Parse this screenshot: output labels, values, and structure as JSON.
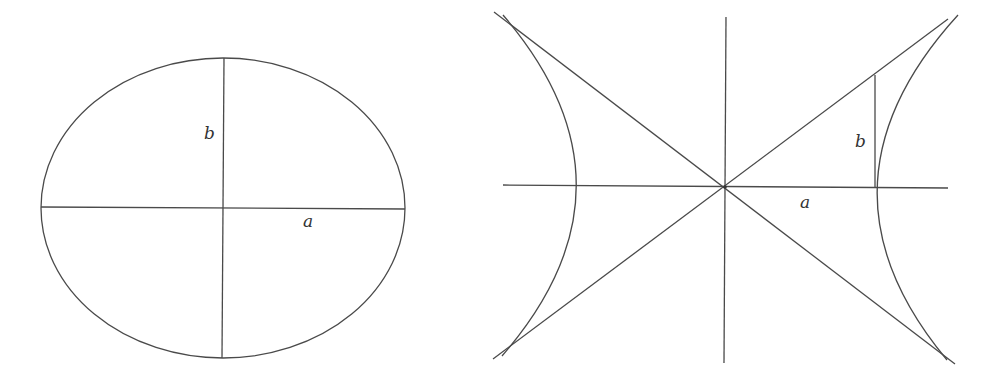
{
  "figures": [
    {
      "name": "ellipse",
      "labels": {
        "semi_minor": "b",
        "semi_major": "a"
      },
      "geometry": {
        "cx": 223,
        "cy": 208,
        "rx": 182,
        "ry": 150
      }
    },
    {
      "name": "hyperbola",
      "labels": {
        "semi_minor": "b",
        "semi_major": "a"
      },
      "geometry": {
        "cx": 725,
        "cy": 187,
        "a": 150,
        "b": 111
      }
    }
  ],
  "colors": {
    "stroke": "#4a4a4a",
    "background": "#ffffff",
    "text": "#333333"
  }
}
